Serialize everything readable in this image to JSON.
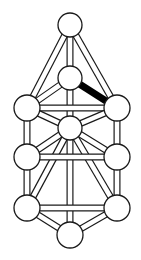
{
  "diagram": {
    "type": "ball-and-stick-graph",
    "background": "#ffffff",
    "stroke_color": "#1a1a1a",
    "node_fill": "#ffffff",
    "highlight_color": "#000000",
    "nodes": [
      {
        "id": "top",
        "x": 70,
        "y": 25,
        "r": 12
      },
      {
        "id": "inner-top",
        "x": 70,
        "y": 78,
        "r": 12
      },
      {
        "id": "left-mid",
        "x": 27,
        "y": 108,
        "r": 13
      },
      {
        "id": "right-mid",
        "x": 117,
        "y": 108,
        "r": 13
      },
      {
        "id": "center",
        "x": 70,
        "y": 128,
        "r": 12
      },
      {
        "id": "left-lower",
        "x": 27,
        "y": 157,
        "r": 13
      },
      {
        "id": "right-lower",
        "x": 117,
        "y": 157,
        "r": 13
      },
      {
        "id": "bottom-left",
        "x": 27,
        "y": 208,
        "r": 13
      },
      {
        "id": "bottom-right",
        "x": 117,
        "y": 208,
        "r": 13
      },
      {
        "id": "bottom",
        "x": 70,
        "y": 235,
        "r": 13
      }
    ],
    "edges": [
      {
        "from": "top",
        "to": "inner-top"
      },
      {
        "from": "top",
        "to": "left-mid"
      },
      {
        "from": "top",
        "to": "right-mid"
      },
      {
        "from": "inner-top",
        "to": "left-mid"
      },
      {
        "from": "inner-top",
        "to": "right-mid",
        "highlight": true
      },
      {
        "from": "inner-top",
        "to": "center"
      },
      {
        "from": "left-mid",
        "to": "right-mid"
      },
      {
        "from": "left-mid",
        "to": "center"
      },
      {
        "from": "right-mid",
        "to": "center"
      },
      {
        "from": "left-mid",
        "to": "left-lower"
      },
      {
        "from": "right-mid",
        "to": "right-lower"
      },
      {
        "from": "center",
        "to": "left-lower"
      },
      {
        "from": "center",
        "to": "right-lower"
      },
      {
        "from": "center",
        "to": "bottom-left"
      },
      {
        "from": "center",
        "to": "bottom-right"
      },
      {
        "from": "center",
        "to": "bottom"
      },
      {
        "from": "left-lower",
        "to": "right-lower"
      },
      {
        "from": "left-lower",
        "to": "bottom-left"
      },
      {
        "from": "right-lower",
        "to": "bottom-right"
      },
      {
        "from": "bottom-left",
        "to": "bottom-right"
      },
      {
        "from": "bottom-left",
        "to": "bottom"
      },
      {
        "from": "bottom-right",
        "to": "bottom"
      }
    ],
    "bond_width": 7,
    "bond_inner_width": 4.6,
    "node_stroke_width": 1.3
  }
}
